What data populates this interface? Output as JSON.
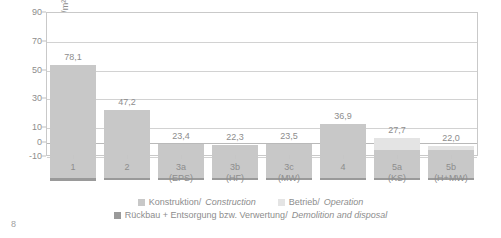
{
  "page": {
    "page_number": "8"
  },
  "chart_data": {
    "type": "bar",
    "title": "",
    "subtitle": "",
    "xlabel": "",
    "ylabel": "GWP [kg CO2-Äq./m²a]",
    "ylabel_parts": {
      "prefix": "GWP [kg CO",
      "sub": "2",
      "suffix": "-Äq./m²a]"
    },
    "ylim": [
      -10,
      90
    ],
    "yticks": [
      90,
      70,
      50,
      30,
      10,
      0,
      -10
    ],
    "ytick_labels": [
      "90",
      "70",
      "50",
      "30",
      "10",
      "0",
      "-10"
    ],
    "grid": true,
    "legend_position": "bottom",
    "categories": [
      "1",
      "2",
      "3a",
      "3b",
      "3c",
      "4",
      "5a",
      "5b"
    ],
    "category_sublabels": [
      "",
      "",
      "(EPS)",
      "(HF)",
      "(MW)",
      "",
      "(KS)",
      "(H+MW)"
    ],
    "totals": [
      78.1,
      47.2,
      23.4,
      22.3,
      23.5,
      36.9,
      27.7,
      22.0
    ],
    "total_labels": [
      "78,1",
      "47,2",
      "23,4",
      "22,3",
      "23,5",
      "36,9",
      "27,7",
      "22,0"
    ],
    "series": [
      {
        "name": "Konstruktion/Construction",
        "key": "construction",
        "color": "#c8c8c8",
        "values": [
          78.1,
          47.2,
          23.4,
          22.3,
          23.5,
          36.9,
          19.0,
          19.5
        ]
      },
      {
        "name": "Betrieb/Operation",
        "key": "operation",
        "color": "#e4e4e4",
        "values": [
          0,
          0,
          0,
          0,
          0,
          0,
          8.7,
          2.5
        ]
      },
      {
        "name": "Rückbau + Entsorgung bzw. Verwertung/Demolition and disposal",
        "key": "demolition",
        "color": "#9a9a9a",
        "values": [
          -2.4,
          -2.0,
          -1.6,
          -1.6,
          -1.6,
          -2.0,
          -1.6,
          -1.8
        ]
      }
    ]
  },
  "legend": {
    "items": [
      {
        "label_de": "Konstruktion/",
        "label_en": "Construction",
        "color": "#c8c8c8"
      },
      {
        "label_de": "Betrieb/",
        "label_en": "Operation",
        "color": "#e4e4e4"
      },
      {
        "label_de": "Rückbau + Entsorgung bzw. Verwertung/",
        "label_en": "Demolition and disposal",
        "color": "#9a9a9a"
      }
    ]
  }
}
